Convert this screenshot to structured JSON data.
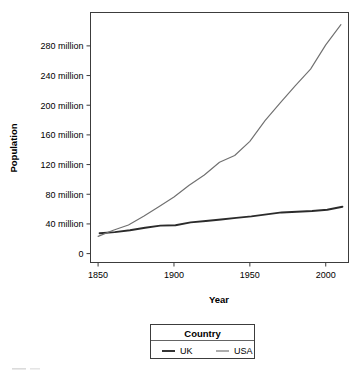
{
  "chart_data": {
    "type": "line",
    "title": "",
    "xlabel": "Year",
    "ylabel": "Population",
    "xlim": [
      1845,
      2015
    ],
    "ylim": [
      -12,
      325
    ],
    "grid": false,
    "legend_position": "bottom",
    "legend_title": "Country",
    "x_tick_labels": [
      "1850",
      "1900",
      "1950",
      "2000"
    ],
    "x_ticks": [
      1850,
      1900,
      1950,
      2000
    ],
    "y_tick_labels": [
      "0",
      "40 million",
      "80 million",
      "120 million",
      "160 million",
      "200 million",
      "240 million",
      "280 million"
    ],
    "y_ticks": [
      0,
      40,
      80,
      120,
      160,
      200,
      240,
      280
    ],
    "y_unit": "million",
    "series": [
      {
        "name": "UK",
        "color": "#2b2b2b",
        "width": 1.9,
        "x": [
          1851,
          1861,
          1871,
          1881,
          1891,
          1901,
          1911,
          1921,
          1931,
          1941,
          1951,
          1961,
          1971,
          1981,
          1991,
          2001,
          2011
        ],
        "values": [
          27.4,
          28.9,
          31.5,
          34.9,
          37.7,
          38.2,
          42.1,
          44.0,
          46.0,
          48.2,
          50.2,
          52.8,
          55.5,
          56.4,
          57.4,
          59.1,
          63.2
        ]
      },
      {
        "name": "USA",
        "color": "#707070",
        "width": 1.15,
        "x": [
          1850,
          1860,
          1870,
          1880,
          1890,
          1900,
          1910,
          1920,
          1930,
          1940,
          1950,
          1960,
          1970,
          1980,
          1990,
          2000,
          2010
        ],
        "values": [
          23.2,
          31.4,
          38.6,
          50.2,
          63.0,
          76.2,
          92.2,
          106.0,
          123.2,
          132.2,
          151.3,
          179.3,
          203.2,
          226.5,
          248.7,
          281.4,
          308.7
        ]
      }
    ]
  },
  "legend": {
    "title": "Country",
    "entries": [
      {
        "label": "UK",
        "color": "#2b2b2b"
      },
      {
        "label": "USA",
        "color": "#707070"
      }
    ]
  },
  "axes": {
    "x_title": "Year",
    "y_title": "Population"
  }
}
